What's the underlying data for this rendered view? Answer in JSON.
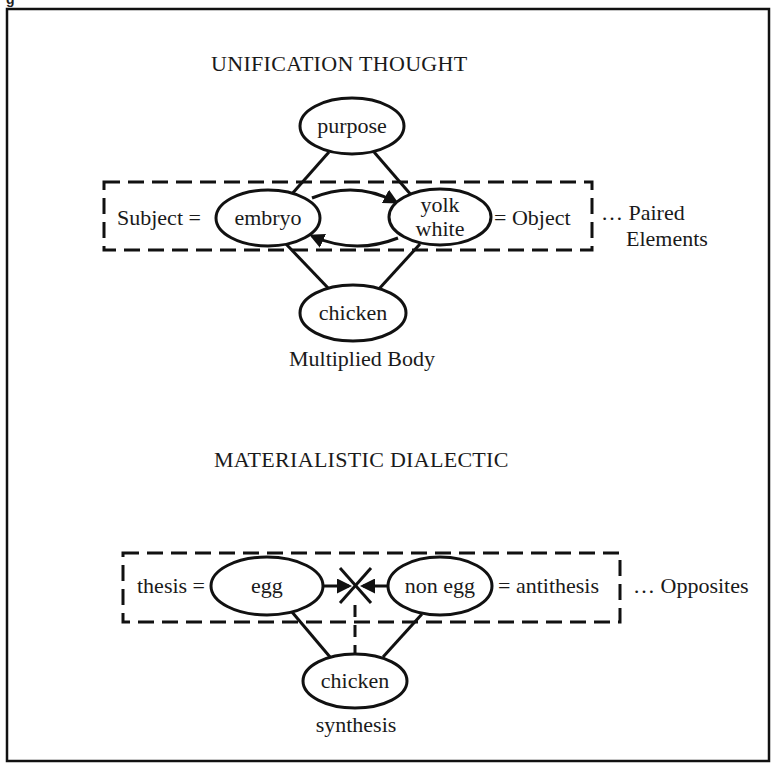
{
  "figure": {
    "caption_fragment": "g"
  },
  "unification": {
    "title": "UNIFICATION THOUGHT",
    "top_node": "purpose",
    "subject_label": "Subject =",
    "subject_node": "embryo",
    "object_node_line1": "yolk",
    "object_node_line2": "white",
    "object_label": "= Object",
    "paired_line1": "… Paired",
    "paired_line2": "Elements",
    "bottom_node": "chicken",
    "bottom_caption": "Multiplied Body"
  },
  "dialectic": {
    "title": "MATERIALISTIC DIALECTIC",
    "thesis_label": "thesis =",
    "thesis_node": "egg",
    "antithesis_node": "non egg",
    "antithesis_label": "= antithesis",
    "opposites_label": "… Opposites",
    "bottom_node": "chicken",
    "bottom_caption": "synthesis"
  }
}
